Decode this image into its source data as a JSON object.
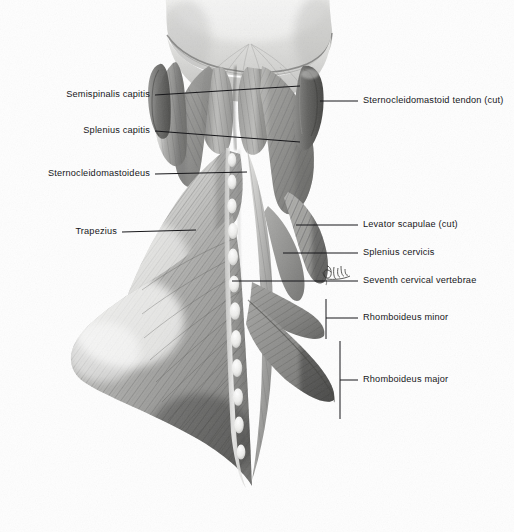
{
  "figure": {
    "kind": "anatomical-illustration",
    "medium": "graphite / halftone shaded drawing",
    "background_color": "#fefefe",
    "ink_color": "#17171a",
    "artist_mark": "Gilek"
  },
  "labels": {
    "left": [
      {
        "id": "semispinalis-capitis",
        "text": "Semispinalis capitis",
        "x": 150,
        "y": 95,
        "tip_x": 300,
        "tip_y": 86
      },
      {
        "id": "splenius-capitis",
        "text": "Splenius capitis",
        "x": 150,
        "y": 131,
        "tip_x": 300,
        "tip_y": 142
      },
      {
        "id": "sternocleidomastoideus",
        "text": "Sternocleidomastoideus",
        "x": 150,
        "y": 174,
        "tip_x": 247,
        "tip_y": 172
      },
      {
        "id": "trapezius",
        "text": "Trapezius",
        "x": 117,
        "y": 232,
        "tip_x": 196,
        "tip_y": 230
      }
    ],
    "right": [
      {
        "id": "sternocleidomastoid-tendon-cut",
        "text": "Sternocleidomastoid tendon (cut)",
        "x": 363,
        "y": 101,
        "tip_x": 320,
        "tip_y": 101
      },
      {
        "id": "levator-scapulae-cut",
        "text": "Levator scapulae (cut)",
        "x": 363,
        "y": 225,
        "tip_x": 296,
        "tip_y": 225
      },
      {
        "id": "splenius-cervicis",
        "text": "Splenius cervicis",
        "x": 363,
        "y": 253,
        "tip_x": 283,
        "tip_y": 253
      },
      {
        "id": "seventh-cervical-vertebrae",
        "text": "Seventh cervical vertebrae",
        "x": 363,
        "y": 281,
        "tip_x": 232,
        "tip_y": 281
      }
    ],
    "bracketed": [
      {
        "id": "rhomboideus-minor",
        "text": "Rhomboideus minor",
        "x": 363,
        "y": 318,
        "bracket_x": 326,
        "bracket_top": 299,
        "bracket_bottom": 339,
        "leader_to": 358
      },
      {
        "id": "rhomboideus-major",
        "text": "Rhomboideus major",
        "x": 363,
        "y": 380,
        "bracket_x": 340,
        "bracket_top": 341,
        "bracket_bottom": 419,
        "leader_to": 358
      }
    ]
  },
  "anatomy": {
    "structures": [
      "scalp / cranial vault (reflected)",
      "occipital bone with nuchal line",
      "semispinalis capitis",
      "splenius capitis",
      "sternocleidomastoideus",
      "sternocleidomastoid tendon (cut)",
      "levator scapulae (cut)",
      "splenius cervicis",
      "seventh cervical vertebra (vertebra prominens)",
      "cervical and thoracic spinous processes",
      "trapezius",
      "rhomboideus minor",
      "rhomboideus major"
    ],
    "spinous_process_count": 12
  }
}
